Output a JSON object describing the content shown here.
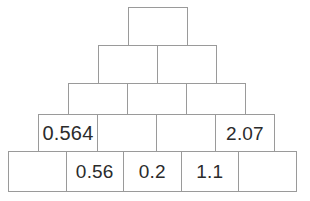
{
  "diagram": {
    "type": "number-pyramid",
    "style": {
      "border_color": "#9a9a9a",
      "text_color": "#2b2b2b",
      "background_color": "#ffffff"
    },
    "rows": [
      {
        "index": 1,
        "cell_count": 1,
        "cells": [
          {
            "value": "",
            "filled": false
          }
        ]
      },
      {
        "index": 2,
        "cell_count": 2,
        "cells": [
          {
            "value": "",
            "filled": false
          },
          {
            "value": "",
            "filled": false
          }
        ]
      },
      {
        "index": 3,
        "cell_count": 3,
        "cells": [
          {
            "value": "",
            "filled": false
          },
          {
            "value": "",
            "filled": false
          },
          {
            "value": "",
            "filled": false
          }
        ]
      },
      {
        "index": 4,
        "cell_count": 4,
        "cells": [
          {
            "value": "0.564",
            "filled": true
          },
          {
            "value": "",
            "filled": false
          },
          {
            "value": "",
            "filled": false
          },
          {
            "value": "2.07",
            "filled": true
          }
        ]
      },
      {
        "index": 5,
        "cell_count": 5,
        "cells": [
          {
            "value": "",
            "filled": false
          },
          {
            "value": "0.56",
            "filled": true
          },
          {
            "value": "0.2",
            "filled": true
          },
          {
            "value": "1.1",
            "filled": true
          },
          {
            "value": "",
            "filled": false
          }
        ]
      }
    ]
  }
}
